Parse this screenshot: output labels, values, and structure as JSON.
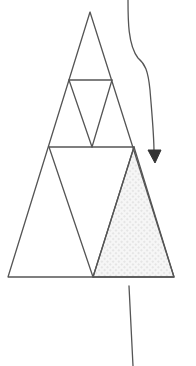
{
  "diagram": {
    "colors": {
      "background": "#ffffff",
      "line": "#555555",
      "arrow": "#333333",
      "shade_dot": "#c8c8c8",
      "shade_bg": "#f4f4f4"
    },
    "outer_triangle": {
      "apex": [
        90,
        12
      ],
      "base_left": [
        8,
        277
      ],
      "base_right": [
        174,
        277
      ]
    },
    "levels": [
      {
        "name": "top-triangle",
        "points": [
          [
            90,
            12
          ],
          [
            69,
            80
          ],
          [
            112,
            80
          ]
        ]
      },
      {
        "name": "middle-inverted-triangle",
        "points": [
          [
            69,
            80
          ],
          [
            112,
            80
          ],
          [
            92,
            147
          ]
        ]
      },
      {
        "name": "middle-left-triangle",
        "points": [
          [
            69,
            80
          ],
          [
            49,
            147
          ],
          [
            92,
            147
          ]
        ]
      },
      {
        "name": "middle-right-triangle",
        "points": [
          [
            112,
            80
          ],
          [
            92,
            147
          ],
          [
            134,
            147
          ]
        ]
      },
      {
        "name": "bottom-inverted-triangle",
        "points": [
          [
            49,
            147
          ],
          [
            134,
            147
          ],
          [
            93,
            277
          ]
        ]
      },
      {
        "name": "bottom-left-triangle",
        "points": [
          [
            49,
            147
          ],
          [
            8,
            277
          ],
          [
            93,
            277
          ]
        ]
      },
      {
        "name": "bottom-right-shaded-triangle",
        "points": [
          [
            134,
            147
          ],
          [
            93,
            277
          ],
          [
            174,
            277
          ]
        ],
        "shaded": true
      }
    ],
    "arrow": {
      "start": [
        128,
        0
      ],
      "end": [
        155,
        163
      ],
      "direction": "down"
    },
    "vertical_line": {
      "start": [
        129,
        285
      ],
      "end": [
        133,
        366
      ]
    }
  }
}
